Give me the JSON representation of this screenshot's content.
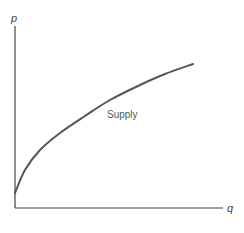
{
  "chart_data": {
    "type": "line",
    "title": "",
    "xlabel": "q",
    "ylabel": "p",
    "grid": false,
    "legend": null,
    "series": [
      {
        "name": "Supply",
        "shape": "concave increasing",
        "points_px": [
          [
            15,
            193
          ],
          [
            25,
            170
          ],
          [
            40,
            150
          ],
          [
            60,
            133
          ],
          [
            85,
            116
          ],
          [
            110,
            100
          ],
          [
            140,
            85
          ],
          [
            165,
            74
          ],
          [
            193,
            64
          ]
        ]
      }
    ],
    "annotations": [
      {
        "text": "Supply",
        "x_px": 107,
        "y_px": 118
      }
    ],
    "colors": {
      "axes": "#444444",
      "curve": "#555555",
      "text": "#555555"
    }
  },
  "labels": {
    "y_axis": "p",
    "x_axis": "q",
    "curve": "Supply"
  }
}
